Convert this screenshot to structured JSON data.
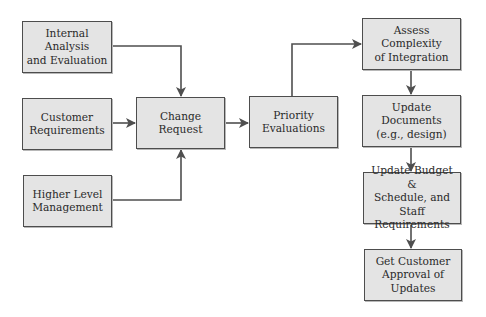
{
  "diagram": {
    "type": "flowchart",
    "nodes": {
      "internal_analysis": {
        "label": "Internal Analysis\nand Evaluation"
      },
      "customer_requirements": {
        "label": "Customer\nRequirements"
      },
      "higher_level_management": {
        "label": "Higher Level\nManagement"
      },
      "change_request": {
        "label": "Change Request"
      },
      "priority_evaluations": {
        "label": "Priority\nEvaluations"
      },
      "assess_complexity": {
        "label": "Assess Complexity\nof Integration"
      },
      "update_documents": {
        "label": "Update Documents\n(e.g., design)"
      },
      "update_budget": {
        "label": "Update Budget &\nSchedule, and Staff\nRequirements"
      },
      "customer_approval": {
        "label": "Get Customer\nApproval of Updates"
      }
    },
    "edges": [
      {
        "from": "internal_analysis",
        "to": "change_request"
      },
      {
        "from": "customer_requirements",
        "to": "change_request"
      },
      {
        "from": "higher_level_management",
        "to": "change_request"
      },
      {
        "from": "change_request",
        "to": "priority_evaluations"
      },
      {
        "from": "priority_evaluations",
        "to": "assess_complexity"
      },
      {
        "from": "assess_complexity",
        "to": "update_documents"
      },
      {
        "from": "update_documents",
        "to": "update_budget"
      },
      {
        "from": "update_budget",
        "to": "customer_approval"
      }
    ],
    "colors": {
      "box_fill": "#e4e4e4",
      "box_border": "#4d4d4d",
      "connector": "#4f4f4f",
      "text": "#2a2a2a"
    }
  }
}
